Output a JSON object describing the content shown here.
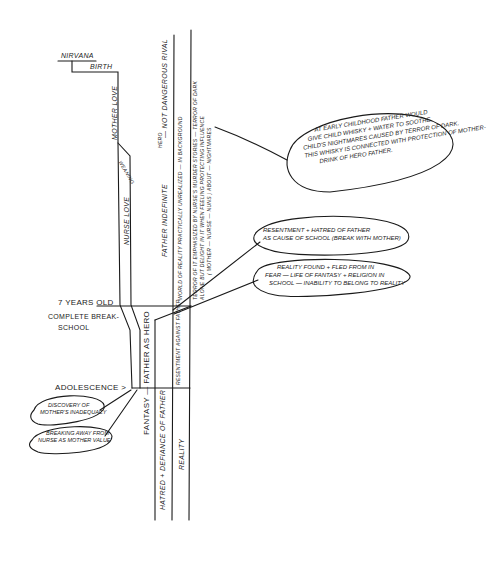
{
  "timeline_labels": {
    "nirvana": "Nirvana",
    "birth": "Birth",
    "seven_years_line1": "7 Years Old",
    "seven_years_line2": "Complete Break-",
    "seven_years_line3": "School",
    "adolescence": "Adolescence >"
  },
  "channel_labels": {
    "mother_love": "Mother Love",
    "weaning": "Weaning",
    "nurse_love": "Nurse Love",
    "father_indefinite": "Father Indefinite",
    "hero_caret": "Hero",
    "not_dangerous_rival": "— Not Dangerous Rival",
    "world_of_reality": "World of Reality Practically Unrealized — In Background",
    "terror_line1": "Terror of it Emphasized by Nurse's Murder Stories — Terror of Dark",
    "terror_line2": "Alone but Delight in it when Feeling Protecting Influence",
    "terror_line3": "( Mother — Nurse — Nuns ) About — Nightmares",
    "fantasy_father_hero": "Fantasy — Father as Hero",
    "resentment_against_father": "Resentment against Father",
    "hatred_defiance": "Hatred + Defiance of Father",
    "reality": "Reality"
  },
  "bubbles": [
    {
      "id": "whisky",
      "lines": [
        "At early childhood father would",
        "give child whisky + water to soothe",
        "child's nightmares caused by terror of dark.",
        "This whisky is connected with protection of mother-",
        "drink of hero father."
      ]
    },
    {
      "id": "resentment",
      "lines": [
        "Resentment + hatred of father",
        "as cause of school (break with mother)"
      ]
    },
    {
      "id": "reality-found",
      "lines": [
        "Reality found + fled from in",
        "fear — life of fantasy + religion in",
        "school — inability to belong to reality"
      ]
    },
    {
      "id": "mother-inadequacy",
      "lines": [
        "Discovery of",
        "Mother's inadequacy"
      ]
    },
    {
      "id": "breaking-away",
      "lines": [
        "Breaking away from",
        "nurse as mother value"
      ]
    }
  ],
  "colors": {
    "ink": "#1a1a1a",
    "paper": "#ffffff"
  }
}
